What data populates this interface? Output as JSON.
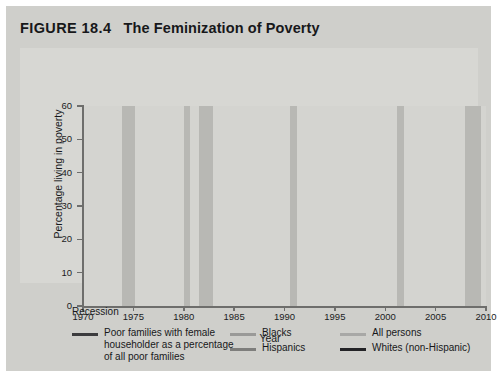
{
  "figure": {
    "number": "FIGURE 18.4",
    "title": "The Feminization of Poverty",
    "background": "#cfcfcb",
    "plot_background": "#d4d4d0"
  },
  "legend": {
    "recession_label": "Recession",
    "entries": [
      {
        "label": "Poor families with female\nhouseholder as a percentage\nof all poor families",
        "color": "#3c3c3e",
        "width": 3.4
      },
      {
        "label": "Blacks",
        "color": "#9a9a98",
        "width": 2.6
      },
      {
        "label": "All persons",
        "color": "#a8a8a6",
        "width": 2.6
      },
      {
        "label": "Hispanics",
        "color": "#7e7e7c",
        "width": 2.6
      },
      {
        "label": "Whites (non-Hispanic)",
        "color": "#232326",
        "width": 3.0
      }
    ]
  },
  "chart_data": {
    "type": "line",
    "title": "The Feminization of Poverty",
    "xlabel": "Year",
    "ylabel": "Percentage living in poverty",
    "xlim": [
      1970,
      2010
    ],
    "ylim": [
      0,
      60
    ],
    "xticks": [
      1970,
      1975,
      1980,
      1985,
      1990,
      1995,
      2000,
      2005,
      2010
    ],
    "yticks": [
      0,
      10,
      20,
      30,
      40,
      50,
      60
    ],
    "grid": false,
    "legend_position": "below",
    "recessions": [
      {
        "start": 1973.9,
        "end": 1975.2
      },
      {
        "start": 1980.0,
        "end": 1980.6
      },
      {
        "start": 1981.5,
        "end": 1982.9
      },
      {
        "start": 1990.5,
        "end": 1991.2
      },
      {
        "start": 2001.2,
        "end": 2001.9
      },
      {
        "start": 2007.9,
        "end": 2009.5
      }
    ],
    "series": [
      {
        "name": "Poor families with female householder as a percentage of all poor families",
        "color": "#3c3c3e",
        "width": 2.6,
        "x": [
          1970,
          1971,
          1972,
          1973,
          1974,
          1975,
          1976,
          1977,
          1978,
          1979,
          1980,
          1981,
          1982,
          1983,
          1984,
          1985,
          1986,
          1987,
          1988,
          1989,
          1990,
          1991,
          1992,
          1993,
          1994,
          1995,
          1996,
          1997,
          1998,
          1999,
          2000,
          2001,
          2002,
          2003,
          2004,
          2005,
          2006,
          2007,
          2008,
          2009,
          2010
        ],
        "y": [
          37.1,
          38.8,
          41.1,
          42.2,
          41.6,
          39.3,
          41.9,
          43.3,
          44.9,
          43.0,
          42.0,
          41.6,
          41.8,
          42.1,
          43.0,
          44.1,
          45.6,
          46.5,
          45.9,
          47.6,
          50.0,
          49.3,
          50.1,
          51.7,
          51.5,
          52.3,
          51.5,
          52.4,
          53.1,
          52.9,
          52.8,
          51.5,
          50.9,
          51.6,
          51.8,
          51.9,
          51.5,
          51.9,
          52.6,
          52.7,
          51.5
        ]
      },
      {
        "name": "Blacks",
        "color": "#9a9a98",
        "width": 2.2,
        "x": [
          1970,
          1971,
          1972,
          1973,
          1974,
          1975,
          1976,
          1977,
          1978,
          1979,
          1980,
          1981,
          1982,
          1983,
          1984,
          1985,
          1986,
          1987,
          1988,
          1989,
          1990,
          1991,
          1992,
          1993,
          1994,
          1995,
          1996,
          1997,
          1998,
          1999,
          2000,
          2001,
          2002,
          2003,
          2004,
          2005,
          2006,
          2007,
          2008,
          2009,
          2010
        ],
        "y": [
          33.5,
          32.5,
          33.3,
          31.4,
          30.3,
          31.3,
          31.1,
          31.3,
          30.6,
          31.0,
          32.5,
          34.2,
          35.6,
          35.7,
          33.8,
          31.3,
          31.1,
          32.4,
          31.3,
          30.7,
          31.9,
          32.7,
          33.4,
          33.1,
          30.6,
          29.3,
          28.4,
          26.5,
          26.1,
          23.6,
          22.5,
          22.7,
          24.1,
          24.4,
          24.7,
          24.9,
          24.3,
          24.5,
          24.7,
          25.8,
          27.4
        ]
      },
      {
        "name": "Hispanics",
        "color": "#7e7e7c",
        "width": 2.2,
        "x": [
          1972,
          1973,
          1974,
          1975,
          1976,
          1977,
          1978,
          1979,
          1980,
          1981,
          1982,
          1983,
          1984,
          1985,
          1986,
          1987,
          1988,
          1989,
          1990,
          1991,
          1992,
          1993,
          1994,
          1995,
          1996,
          1997,
          1998,
          1999,
          2000,
          2001,
          2002,
          2003,
          2004,
          2005,
          2006,
          2007,
          2008,
          2009,
          2010
        ],
        "y": [
          22.8,
          21.9,
          23.0,
          26.9,
          24.7,
          22.4,
          21.6,
          21.8,
          25.7,
          26.5,
          29.9,
          28.0,
          28.4,
          29.0,
          27.3,
          28.0,
          26.7,
          26.2,
          28.1,
          28.7,
          29.6,
          30.6,
          30.7,
          30.3,
          29.4,
          27.1,
          25.6,
          22.7,
          21.5,
          21.4,
          21.8,
          22.5,
          21.9,
          21.8,
          20.6,
          21.5,
          23.2,
          25.3,
          26.6
        ]
      },
      {
        "name": "All persons",
        "color": "#a8a8a6",
        "width": 2.2,
        "x": [
          1970,
          1971,
          1972,
          1973,
          1974,
          1975,
          1976,
          1977,
          1978,
          1979,
          1980,
          1981,
          1982,
          1983,
          1984,
          1985,
          1986,
          1987,
          1988,
          1989,
          1990,
          1991,
          1992,
          1993,
          1994,
          1995,
          1996,
          1997,
          1998,
          1999,
          2000,
          2001,
          2002,
          2003,
          2004,
          2005,
          2006,
          2007,
          2008,
          2009,
          2010
        ],
        "y": [
          12.6,
          12.5,
          11.9,
          11.1,
          11.2,
          12.3,
          11.8,
          11.6,
          11.4,
          11.7,
          13.0,
          14.0,
          15.0,
          15.2,
          14.4,
          14.0,
          13.6,
          13.4,
          13.0,
          12.8,
          13.5,
          14.2,
          14.8,
          15.1,
          14.5,
          13.8,
          13.7,
          13.3,
          12.7,
          11.9,
          11.3,
          11.7,
          12.1,
          12.5,
          12.7,
          12.6,
          12.3,
          12.5,
          13.2,
          14.3,
          15.1
        ]
      },
      {
        "name": "Whites (non-Hispanic)",
        "color": "#232326",
        "width": 2.4,
        "x": [
          1970,
          1971,
          1972,
          1973,
          1974,
          1975,
          1976,
          1977,
          1978,
          1979,
          1980,
          1981,
          1982,
          1983,
          1984,
          1985,
          1986,
          1987,
          1988,
          1989,
          1990,
          1991,
          1992,
          1993,
          1994,
          1995,
          1996,
          1997,
          1998,
          1999,
          2000,
          2001,
          2002,
          2003,
          2004,
          2005,
          2006,
          2007,
          2008,
          2009,
          2010
        ],
        "y": [
          9.9,
          9.9,
          9.0,
          8.4,
          8.6,
          9.7,
          9.1,
          8.9,
          8.7,
          9.0,
          10.2,
          11.1,
          12.0,
          12.1,
          11.5,
          11.4,
          11.0,
          10.4,
          10.1,
          10.0,
          10.7,
          11.3,
          11.9,
          12.2,
          11.7,
          11.2,
          11.2,
          11.0,
          10.5,
          9.8,
          9.5,
          9.9,
          8.0,
          8.2,
          8.6,
          8.3,
          8.2,
          8.2,
          8.6,
          9.4,
          9.9
        ]
      }
    ]
  },
  "axes": {
    "y_ticks": [
      "0",
      "10",
      "20",
      "30",
      "40",
      "50",
      "60"
    ],
    "x_ticks": [
      "1970",
      "1975",
      "1980",
      "1985",
      "1990",
      "1995",
      "2000",
      "2005",
      "2010"
    ],
    "y_title": "Percentage living in poverty",
    "x_title": "Year"
  }
}
